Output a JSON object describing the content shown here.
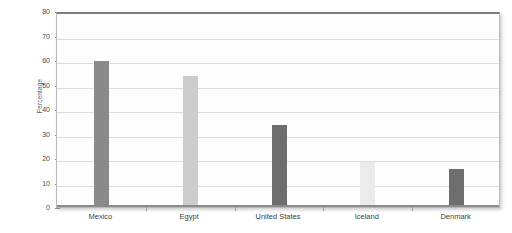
{
  "chart_data": {
    "type": "bar",
    "title": "",
    "xlabel": "",
    "ylabel": "Percentage",
    "categories": [
      "Mexico",
      "Egypt",
      "United States",
      "Iceland",
      "Denmark"
    ],
    "values": [
      59,
      53,
      33,
      18,
      15
    ],
    "ylim": [
      0,
      80
    ],
    "yticks": [
      0,
      10,
      20,
      30,
      40,
      50,
      60,
      70,
      80
    ],
    "ytick_labels": [
      "0",
      "10",
      "20",
      "30",
      "40",
      "50",
      "60",
      "70",
      "80"
    ],
    "grid": true,
    "legend": "none",
    "bar_colors": [
      "#8a8a8a",
      "#cccccc",
      "#6e6e6e",
      "#ebebeb",
      "#6e6e6e"
    ],
    "series": [
      {
        "name": "Percentage",
        "values": [
          59,
          53,
          33,
          18,
          15
        ]
      }
    ],
    "annotations": []
  },
  "figure": {
    "background_color": "#ffffff",
    "plot_background_color": "#fdfdfd",
    "frame_color": "#b9b9b9",
    "gridline_color": "#dddddd",
    "axis_text_color": "#4a4a4a"
  }
}
